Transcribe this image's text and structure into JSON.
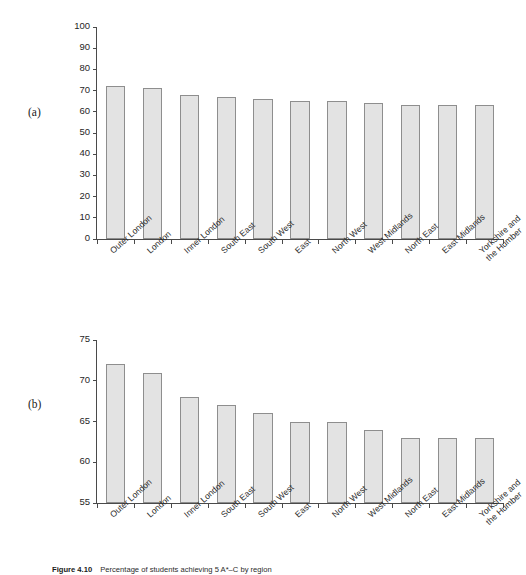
{
  "figure": {
    "panel_a_label": "(a)",
    "panel_b_label": "(b)",
    "caption_figure_word": "Figure",
    "caption_number": "4.10",
    "caption_text": "Percentage of students achieving 5 A*–C by region"
  },
  "chart_data": [
    {
      "type": "bar",
      "panel": "(a)",
      "title": "",
      "xlabel": "",
      "ylabel": "",
      "categories": [
        "Outer London",
        "London",
        "Inner London",
        "South East",
        "South West",
        "East",
        "North West",
        "West Midlands",
        "North East",
        "East Midlands",
        "Yorkshire and the Humber"
      ],
      "values": [
        72,
        71,
        68,
        67,
        66,
        65,
        65,
        64,
        63,
        63,
        63
      ],
      "ylim": [
        0,
        100
      ],
      "yticks": [
        0,
        10,
        20,
        30,
        40,
        50,
        60,
        70,
        80,
        90,
        100
      ],
      "grid": false,
      "legend": "none",
      "bar_fill": "#e3e3e3",
      "bar_stroke": "#8e8e8e"
    },
    {
      "type": "bar",
      "panel": "(b)",
      "title": "",
      "xlabel": "",
      "ylabel": "",
      "categories": [
        "Outer London",
        "London",
        "Inner London",
        "South East",
        "South West",
        "East",
        "North West",
        "West Midlands",
        "North East",
        "East Midlands",
        "Yorkshire and the Humber"
      ],
      "values": [
        72,
        71,
        68,
        67,
        66,
        65,
        65,
        64,
        63,
        63,
        63
      ],
      "ylim": [
        55,
        75
      ],
      "yticks": [
        55,
        60,
        65,
        70,
        75
      ],
      "grid": false,
      "legend": "none",
      "bar_fill": "#e3e3e3",
      "bar_stroke": "#8e8e8e"
    }
  ]
}
